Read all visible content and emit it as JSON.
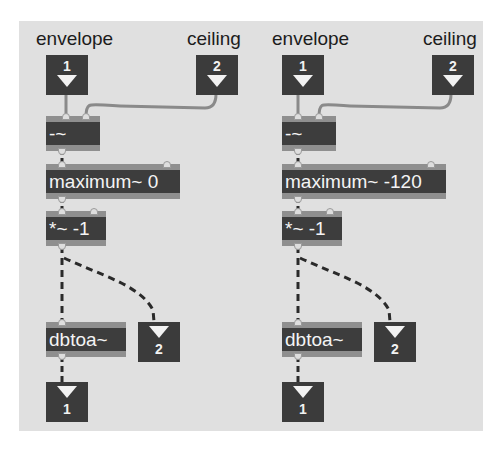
{
  "patch": {
    "background_color": "#e0e0e0",
    "object_color": "#3d3d3d",
    "left": {
      "inlet_labels": [
        "envelope",
        "ceiling"
      ],
      "inlets": [
        {
          "number": "1"
        },
        {
          "number": "2"
        }
      ],
      "objects": {
        "subtract": "-~",
        "maximum": "maximum~ 0",
        "multiply": "*~ -1",
        "dbtoa": "dbtoa~"
      },
      "outlets": [
        {
          "number": "1"
        },
        {
          "number": "2"
        }
      ]
    },
    "right": {
      "inlet_labels": [
        "envelope",
        "ceiling"
      ],
      "inlets": [
        {
          "number": "1"
        },
        {
          "number": "2"
        }
      ],
      "objects": {
        "subtract": "-~",
        "maximum": "maximum~ -120",
        "multiply": "*~ -1",
        "dbtoa": "dbtoa~"
      },
      "outlets": [
        {
          "number": "1"
        },
        {
          "number": "2"
        }
      ]
    }
  }
}
